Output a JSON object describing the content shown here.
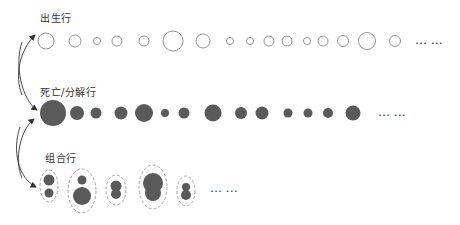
{
  "labels": {
    "birth_row": "出生行",
    "death_row": "死亡/分解行",
    "combine_row": "组合行"
  },
  "ellipsis": "… …",
  "colors": {
    "outline": "#888888",
    "fill_dark": "#5a5a5a",
    "dashed": "#999999",
    "arrow": "#333333",
    "text": "#333333"
  },
  "birth_row": {
    "y": 41,
    "circles": [
      {
        "cx": 46,
        "r": 8
      },
      {
        "cx": 75,
        "r": 6
      },
      {
        "cx": 97,
        "r": 3.5
      },
      {
        "cx": 117,
        "r": 5
      },
      {
        "cx": 144,
        "r": 5
      },
      {
        "cx": 173,
        "r": 10
      },
      {
        "cx": 203,
        "r": 7
      },
      {
        "cx": 230,
        "r": 3.5
      },
      {
        "cx": 250,
        "r": 3.5
      },
      {
        "cx": 269,
        "r": 5
      },
      {
        "cx": 287,
        "r": 5
      },
      {
        "cx": 307,
        "r": 3.5
      },
      {
        "cx": 323,
        "r": 5
      },
      {
        "cx": 343,
        "r": 5.5
      },
      {
        "cx": 367,
        "r": 8.5
      },
      {
        "cx": 395,
        "r": 5.5
      }
    ],
    "ellipsis_x": 415
  },
  "death_row": {
    "y": 113,
    "circles": [
      {
        "cx": 53,
        "r": 13
      },
      {
        "cx": 77,
        "r": 7
      },
      {
        "cx": 96,
        "r": 5.5
      },
      {
        "cx": 121,
        "r": 6.5
      },
      {
        "cx": 144,
        "r": 9
      },
      {
        "cx": 165,
        "r": 4
      },
      {
        "cx": 184,
        "r": 5.5
      },
      {
        "cx": 213,
        "r": 8.5
      },
      {
        "cx": 241,
        "r": 6
      },
      {
        "cx": 262,
        "r": 6.5
      },
      {
        "cx": 288,
        "r": 4.5
      },
      {
        "cx": 308,
        "r": 4.5
      },
      {
        "cx": 328,
        "r": 5
      },
      {
        "cx": 353,
        "r": 7.5
      }
    ],
    "ellipsis_x": 378
  },
  "combine_row": {
    "groups": [
      {
        "cx": 49,
        "cy": 186,
        "rx": 9,
        "ry": 16,
        "circles": [
          {
            "dy": -6,
            "r": 5.5
          },
          {
            "dy": 7,
            "r": 4.5
          }
        ]
      },
      {
        "cx": 82,
        "cy": 191,
        "rx": 14,
        "ry": 22,
        "circles": [
          {
            "dy": -11,
            "r": 4.5
          },
          {
            "dy": 5,
            "r": 9
          }
        ]
      },
      {
        "cx": 116,
        "cy": 190,
        "rx": 10,
        "ry": 15,
        "circles": [
          {
            "dy": -4,
            "r": 5.5
          },
          {
            "dy": 4,
            "r": 5
          }
        ]
      },
      {
        "cx": 153,
        "cy": 187,
        "rx": 14,
        "ry": 22,
        "circles": [
          {
            "dy": -4,
            "r": 10
          },
          {
            "dy": 6,
            "r": 8
          }
        ]
      },
      {
        "cx": 186,
        "cy": 191,
        "rx": 9,
        "ry": 15,
        "circles": [
          {
            "dy": -4,
            "r": 4
          },
          {
            "dy": 4,
            "r": 5
          }
        ]
      }
    ],
    "ellipsis_x": 210,
    "ellipsis_y": 192
  }
}
